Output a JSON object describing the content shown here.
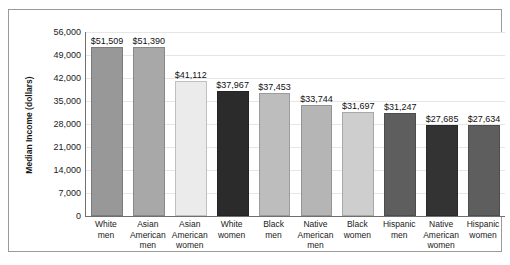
{
  "chart_data": {
    "type": "bar",
    "title": "",
    "xlabel": "",
    "ylabel": "Median Income (dollars)",
    "ylim": [
      0,
      56000
    ],
    "ytick_values": [
      0,
      7000,
      14000,
      21000,
      28000,
      35000,
      42000,
      49000,
      56000
    ],
    "ytick_labels": [
      "0",
      "7,000",
      "14,000",
      "21,000",
      "28,000",
      "35,000",
      "42,000",
      "49,000",
      "56,000"
    ],
    "grid": true,
    "grid_axis": "y",
    "legend": false,
    "categories": [
      "White men",
      "Asian American men",
      "Asian American women",
      "White women",
      "Black men",
      "Native American men",
      "Black women",
      "Hispanic men",
      "Native American women",
      "Hispanic women"
    ],
    "category_lines": [
      [
        "White",
        "men"
      ],
      [
        "Asian",
        "American",
        "men"
      ],
      [
        "Asian",
        "American",
        "women"
      ],
      [
        "White",
        "women"
      ],
      [
        "Black",
        "men"
      ],
      [
        "Native",
        "American",
        "men"
      ],
      [
        "Black",
        "women"
      ],
      [
        "Hispanic",
        "men"
      ],
      [
        "Native",
        "American",
        "women"
      ],
      [
        "Hispanic",
        "women"
      ]
    ],
    "values": [
      51509,
      51390,
      41112,
      37967,
      37453,
      33744,
      31697,
      31247,
      27685,
      27634
    ],
    "data_labels": [
      "$51,509",
      "$51,390",
      "$41,112",
      "$37,967",
      "$37,453",
      "$33,744",
      "$31,697",
      "$31,247",
      "$27,685",
      "$27,634"
    ],
    "bar_colors": [
      "#989898",
      "#a8a8a8",
      "#ebebeb",
      "#2b2b2b",
      "#bdbdbd",
      "#b5b5b5",
      "#cecece",
      "#5e5e5e",
      "#333333",
      "#5e5e5e"
    ]
  },
  "frame": {
    "border_color": "#9a9a9a",
    "axis_color": "#6f6f6f",
    "grid_color": "#e6e6e6",
    "background": "#ffffff"
  }
}
